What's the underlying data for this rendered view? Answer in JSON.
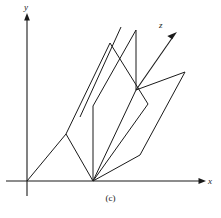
{
  "figure": {
    "caption": "(c)",
    "background_color": "#ffffff",
    "line_color": "#1a1a1a",
    "width": 221,
    "height": 218
  },
  "axes": {
    "origin": {
      "x": 27,
      "y": 181
    },
    "x_axis": {
      "label": "x",
      "start": {
        "x": 6,
        "y": 181
      },
      "end": {
        "x": 206,
        "y": 181
      },
      "arrow": true
    },
    "y_axis": {
      "label": "y",
      "start": {
        "x": 27,
        "y": 196
      },
      "end": {
        "x": 27,
        "y": 15
      },
      "arrow": true
    },
    "z_axis": {
      "label": "z",
      "start": {
        "x": 136,
        "y": 90
      },
      "end": {
        "x": 176,
        "y": 33
      },
      "arrow": true
    }
  },
  "chart_data": {
    "type": "line",
    "title": "(c)",
    "xlabel": "x",
    "ylabel": "y",
    "zlabel": "z",
    "polylines": [
      {
        "name": "origin-ray-to-left-fold",
        "points": [
          [
            27,
            181
          ],
          [
            66,
            134
          ]
        ]
      },
      {
        "name": "left-panel-outline",
        "points": [
          [
            66,
            134
          ],
          [
            110,
            43
          ],
          [
            148,
            104
          ],
          [
            93,
            181
          ],
          [
            66,
            134
          ]
        ]
      },
      {
        "name": "left-panel-inner-crease",
        "points": [
          [
            80,
            117
          ],
          [
            121,
            27
          ]
        ]
      },
      {
        "name": "center-spine-vertical",
        "points": [
          [
            93,
            181
          ],
          [
            93,
            106
          ]
        ]
      },
      {
        "name": "center-crease-to-apex",
        "points": [
          [
            93,
            106
          ],
          [
            136,
            30
          ]
        ]
      },
      {
        "name": "spine-vertical-upper",
        "points": [
          [
            136,
            30
          ],
          [
            136,
            90
          ]
        ]
      },
      {
        "name": "right-panel-upper-edge",
        "points": [
          [
            136,
            90
          ],
          [
            185,
            72
          ]
        ]
      },
      {
        "name": "right-panel-lower-edge",
        "points": [
          [
            185,
            72
          ],
          [
            140,
            155
          ]
        ]
      },
      {
        "name": "right-panel-base-edge",
        "points": [
          [
            140,
            155
          ],
          [
            93,
            181
          ]
        ]
      },
      {
        "name": "right-panel-inner-crease",
        "points": [
          [
            93,
            181
          ],
          [
            136,
            90
          ]
        ]
      },
      {
        "name": "z-axis-ray",
        "points": [
          [
            136,
            90
          ],
          [
            176,
            33
          ]
        ]
      }
    ],
    "vertices": [
      {
        "name": "origin",
        "x": 27,
        "y": 181
      },
      {
        "name": "base-center",
        "x": 93,
        "y": 181
      },
      {
        "name": "left-fold",
        "x": 66,
        "y": 134
      },
      {
        "name": "left-apex",
        "x": 110,
        "y": 43
      },
      {
        "name": "left-crease-top",
        "x": 121,
        "y": 27
      },
      {
        "name": "left-crease-bottom",
        "x": 80,
        "y": 117
      },
      {
        "name": "mid-joint",
        "x": 148,
        "y": 104
      },
      {
        "name": "spine-top",
        "x": 136,
        "y": 30
      },
      {
        "name": "spine-node",
        "x": 136,
        "y": 90
      },
      {
        "name": "center-crease-node",
        "x": 93,
        "y": 106
      },
      {
        "name": "right-apex",
        "x": 185,
        "y": 72
      },
      {
        "name": "right-base",
        "x": 140,
        "y": 155
      }
    ]
  }
}
